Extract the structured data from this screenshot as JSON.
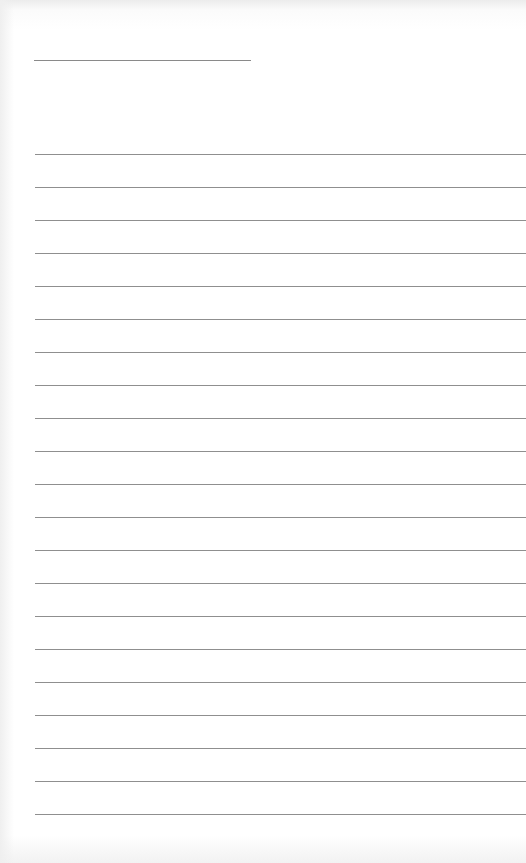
{
  "document": {
    "type": "blank lined writing paper",
    "title_line": {
      "text": "",
      "x": 34,
      "y": 60,
      "width": 217
    },
    "ruled_lines": {
      "count": 21,
      "first_y": 154,
      "spacing": 33,
      "left_x": 35
    },
    "colors": {
      "paper": "#ffffff",
      "rule": "#8f8f8f"
    }
  }
}
